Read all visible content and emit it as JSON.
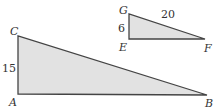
{
  "figure": {
    "fill_color": "#e2e2e2",
    "stroke_color": "#444444",
    "large_triangle": {
      "vertices": [
        "A",
        "B",
        "C"
      ],
      "right_angle_at": "A",
      "side_labels": {
        "AC": "15"
      }
    },
    "small_triangle": {
      "vertices": [
        "E",
        "F",
        "G"
      ],
      "right_angle_at": "E",
      "side_labels": {
        "GE": "6",
        "GF": "20"
      }
    }
  },
  "labels": {
    "A": "A",
    "B": "B",
    "C": "C",
    "E": "E",
    "F": "F",
    "G": "G",
    "side_AC": "15",
    "side_GE": "6",
    "side_GF": "20"
  }
}
